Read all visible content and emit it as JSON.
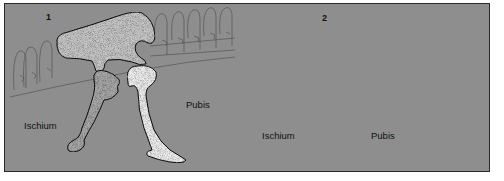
{
  "figure": {
    "panels": [
      {
        "number": "1",
        "labels": {
          "ischium": "Ischium",
          "pubis": "Pubis"
        }
      },
      {
        "number": "2",
        "labels": {
          "ischium": "Ischium",
          "pubis": "Pubis"
        }
      }
    ],
    "colors": {
      "background": "#8e8e8e",
      "ilium": "#c4c4c4",
      "ischium": "#a6a6a6",
      "pubis": "#ececec",
      "outline": "#1a1a1a",
      "vertebrae": "#5a5a5a"
    }
  }
}
